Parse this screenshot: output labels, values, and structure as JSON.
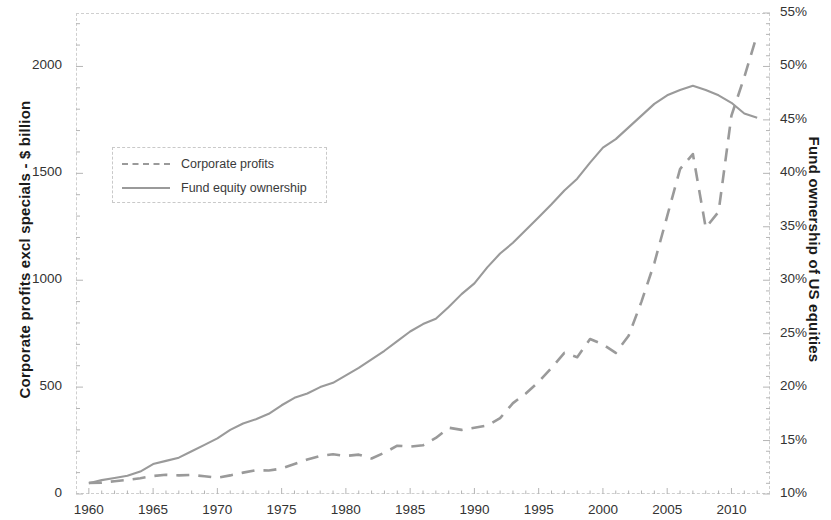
{
  "chart_data": {
    "type": "line",
    "title": "",
    "xlabel": "",
    "ylabel": "Corporate profits excl specials - $ billion",
    "y2label": "Fund ownership of US equities",
    "grid": false,
    "legend_position": "upper-left",
    "xlim": [
      1959,
      2013
    ],
    "ylim": [
      0,
      2250
    ],
    "y2lim": [
      10,
      55
    ],
    "x_tick_labels": [
      "1960",
      "1965",
      "1970",
      "1975",
      "1980",
      "1985",
      "1990",
      "1995",
      "2000",
      "2005",
      "2010"
    ],
    "x_tick_values": [
      1960,
      1965,
      1970,
      1975,
      1980,
      1985,
      1990,
      1995,
      2000,
      2005,
      2010
    ],
    "y_tick_labels": [
      "0",
      "500",
      "1000",
      "1500",
      "2000"
    ],
    "y_tick_values": [
      0,
      500,
      1000,
      1500,
      2000
    ],
    "y2_tick_labels": [
      "10%",
      "15%",
      "20%",
      "25%",
      "30%",
      "35%",
      "40%",
      "45%",
      "50%",
      "55%"
    ],
    "y2_tick_values": [
      10,
      15,
      20,
      25,
      30,
      35,
      40,
      45,
      50,
      55
    ],
    "series": [
      {
        "name": "Corporate profits",
        "axis": "left",
        "style": "dashed",
        "color": "#9a9a9a",
        "units": "$ billion",
        "x": [
          1960,
          1961,
          1962,
          1963,
          1964,
          1965,
          1966,
          1967,
          1968,
          1969,
          1970,
          1971,
          1972,
          1973,
          1974,
          1975,
          1976,
          1977,
          1978,
          1979,
          1980,
          1981,
          1982,
          1983,
          1984,
          1985,
          1986,
          1987,
          1988,
          1989,
          1990,
          1991,
          1992,
          1993,
          1994,
          1995,
          1996,
          1997,
          1998,
          1999,
          2000,
          2001,
          2002,
          2003,
          2004,
          2005,
          2006,
          2007,
          2008,
          2009,
          2010,
          2011,
          2012
        ],
        "values": [
          52,
          53,
          60,
          66,
          74,
          84,
          90,
          87,
          89,
          83,
          76,
          87,
          100,
          111,
          110,
          119,
          140,
          161,
          178,
          186,
          178,
          184,
          166,
          193,
          226,
          222,
          228,
          262,
          310,
          300,
          310,
          320,
          355,
          425,
          470,
          525,
          590,
          660,
          640,
          725,
          700,
          660,
          740,
          900,
          1080,
          1300,
          1520,
          1590,
          1245,
          1320,
          1770,
          1950,
          2150
        ]
      },
      {
        "name": "Fund equity ownership",
        "axis": "right",
        "style": "solid",
        "color": "#9a9a9a",
        "units": "percent of US equities",
        "x": [
          1960,
          1961,
          1962,
          1963,
          1964,
          1965,
          1966,
          1967,
          1968,
          1969,
          1970,
          1971,
          1972,
          1973,
          1974,
          1975,
          1976,
          1977,
          1978,
          1979,
          1980,
          1981,
          1982,
          1983,
          1984,
          1985,
          1986,
          1987,
          1988,
          1989,
          1990,
          1991,
          1992,
          1993,
          1994,
          1995,
          1996,
          1997,
          1998,
          1999,
          2000,
          2001,
          2002,
          2003,
          2004,
          2005,
          2006,
          2007,
          2008,
          2009,
          2010,
          2011,
          2012
        ],
        "values": [
          11.0,
          11.3,
          11.5,
          11.7,
          12.1,
          12.8,
          13.1,
          13.4,
          14.0,
          14.6,
          15.2,
          16.0,
          16.6,
          17.0,
          17.5,
          18.3,
          19.0,
          19.4,
          20.0,
          20.4,
          21.1,
          21.8,
          22.6,
          23.4,
          24.3,
          25.2,
          25.9,
          26.4,
          27.5,
          28.7,
          29.7,
          31.2,
          32.5,
          33.5,
          34.7,
          35.9,
          37.1,
          38.4,
          39.5,
          41.0,
          42.4,
          43.2,
          44.3,
          45.4,
          46.5,
          47.3,
          47.8,
          48.2,
          47.8,
          47.3,
          46.6,
          45.6,
          45.2
        ]
      }
    ]
  },
  "legend": {
    "items": [
      {
        "label": "Corporate profits"
      },
      {
        "label": "Fund equity ownership"
      }
    ]
  }
}
